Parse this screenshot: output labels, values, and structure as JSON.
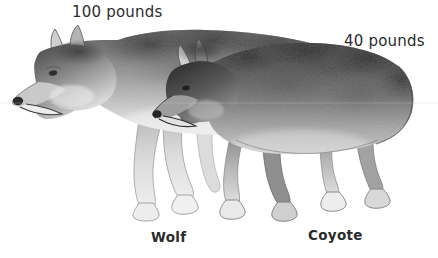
{
  "figure": {
    "background_color": "#ffffff",
    "text_color": "#2b2b2b",
    "illustration_style": "grayscale watercolor drawing of two canines standing in profile facing left, the larger wolf behind and the smaller coyote overlapping in front"
  },
  "labels": {
    "wolf_weight": "100 pounds",
    "coyote_weight": "40 pounds",
    "wolf_name": "Wolf",
    "coyote_name": "Coyote"
  },
  "animals": {
    "wolf": {
      "name": "Wolf",
      "weight": "100 pounds",
      "position": "background, left, larger"
    },
    "coyote": {
      "name": "Coyote",
      "weight": "40 pounds",
      "position": "foreground, right, smaller"
    }
  }
}
